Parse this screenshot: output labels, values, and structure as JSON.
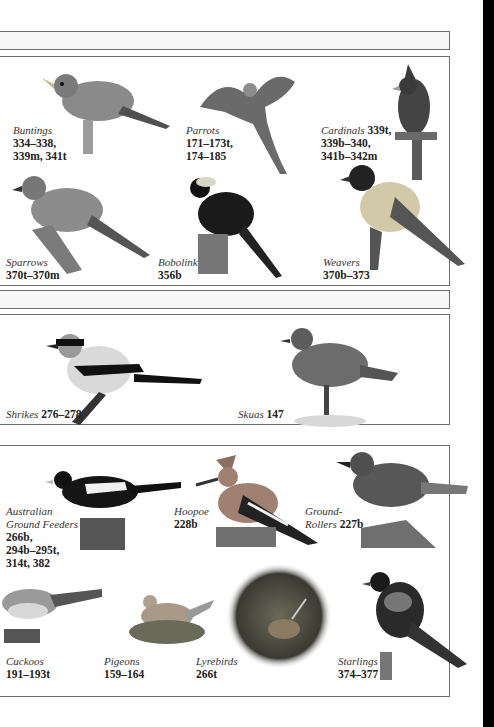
{
  "page": {
    "sections": [
      {
        "id": "passerines-1",
        "birds": [
          {
            "name": "Buntings",
            "pages": [
              "334–338,",
              "339m, 341t"
            ]
          },
          {
            "name": "Parrots",
            "pages": [
              "171–173t,",
              "174–185"
            ]
          },
          {
            "name": "Cardinals",
            "pages_inline": "339t,",
            "pages": [
              "339b–340,",
              "341b–342m"
            ]
          },
          {
            "name": "Sparrows",
            "pages": [
              "370t–370m"
            ]
          },
          {
            "name": "Bobolink",
            "pages": [
              "356b"
            ]
          },
          {
            "name": "Weavers",
            "pages": [
              "370b–373"
            ]
          }
        ]
      },
      {
        "id": "shrikes-skuas",
        "birds": [
          {
            "name": "Shrikes",
            "pages_inline": "276–278"
          },
          {
            "name": "Skuas",
            "pages_inline": "147"
          }
        ]
      },
      {
        "id": "ground-birds",
        "birds": [
          {
            "name_lines": [
              "Australian",
              "Ground Feeders"
            ],
            "pages": [
              "266b,",
              "294b–295t,",
              "314t, 382"
            ]
          },
          {
            "name": "Hoopoe",
            "pages": [
              "228b"
            ]
          },
          {
            "name_lines": [
              "Ground-",
              "Rollers"
            ],
            "pages_inline": "227b"
          },
          {
            "name": "Cuckoos",
            "pages": [
              "191–193t"
            ]
          },
          {
            "name": "Pigeons",
            "pages": [
              "159–164"
            ]
          },
          {
            "name": "Lyrebirds",
            "pages": [
              "266t"
            ]
          },
          {
            "name": "Starlings",
            "pages": [
              "374–377"
            ]
          }
        ]
      }
    ],
    "colors": {
      "border": "#6e6e6e",
      "band": "#f6f6f6",
      "edge": "#000000"
    }
  }
}
